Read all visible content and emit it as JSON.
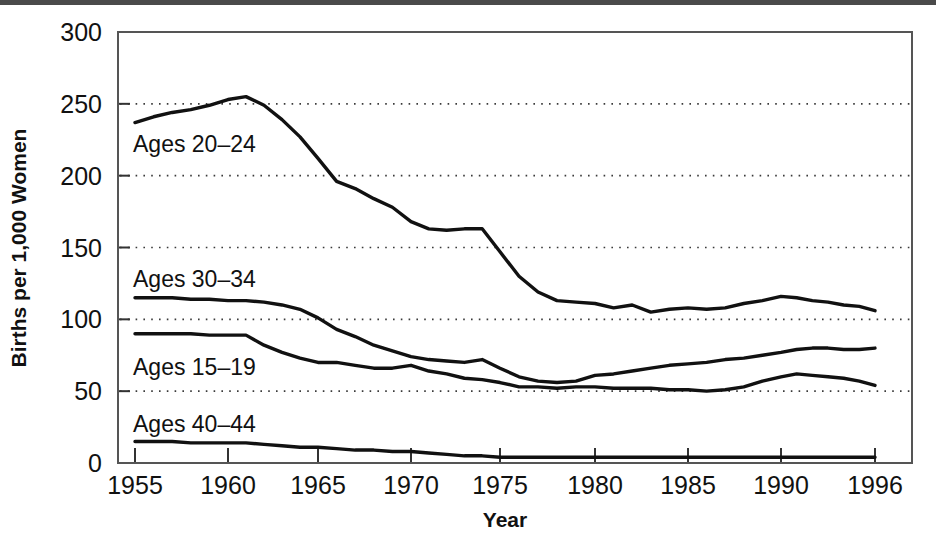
{
  "figure": {
    "name": "birth-rates-by-age-line-chart",
    "background_color": "#ffffff",
    "line_color": "#111111",
    "grid_color": "#3a3a3a",
    "frame_color": "#555555"
  },
  "axes": {
    "x_title": "Year",
    "y_title": "Births per 1,000 Women",
    "x_ticks": [
      "1955",
      "1960",
      "1965",
      "1970",
      "1975",
      "1980",
      "1985",
      "1990",
      "1996"
    ],
    "y_ticks": [
      "0",
      "50",
      "100",
      "150",
      "200",
      "250",
      "300"
    ]
  },
  "series_labels": [
    {
      "text": "Ages 20–24",
      "x": 133,
      "y": 152
    },
    {
      "text": "Ages 30–34",
      "x": 133,
      "y": 287
    },
    {
      "text": "Ages 15–19",
      "x": 133,
      "y": 375
    },
    {
      "text": "Ages 40–44",
      "x": 133,
      "y": 432
    }
  ],
  "chart_data": {
    "type": "line",
    "title": "",
    "xlabel": "Year",
    "ylabel": "Births per 1,000 Women",
    "xlim": [
      1955,
      1996
    ],
    "ylim": [
      0,
      300
    ],
    "grid": true,
    "gridlines_y": [
      50,
      100,
      150,
      200,
      250
    ],
    "legend": "inline-labels",
    "x_tick_values": [
      1955,
      1960,
      1965,
      1970,
      1975,
      1980,
      1985,
      1990,
      1996
    ],
    "y_tick_values": [
      0,
      50,
      100,
      150,
      200,
      250,
      300
    ],
    "x": [
      1955,
      1956,
      1957,
      1958,
      1959,
      1960,
      1961,
      1962,
      1963,
      1964,
      1965,
      1966,
      1967,
      1968,
      1969,
      1970,
      1971,
      1972,
      1973,
      1974,
      1975,
      1976,
      1977,
      1978,
      1979,
      1980,
      1981,
      1982,
      1983,
      1984,
      1985,
      1986,
      1987,
      1988,
      1989,
      1990,
      1991,
      1992,
      1993,
      1994,
      1995,
      1996
    ],
    "series": [
      {
        "name": "Ages 20–24",
        "values": [
          237,
          241,
          244,
          246,
          249,
          253,
          255,
          249,
          239,
          227,
          212,
          196,
          191,
          184,
          178,
          168,
          163,
          162,
          163,
          163,
          147,
          130,
          119,
          113,
          112,
          111,
          108,
          110,
          105,
          107,
          108,
          107,
          108,
          111,
          113,
          116,
          115,
          113,
          112,
          110,
          109,
          106
        ],
        "label_text": "Ages 20–24"
      },
      {
        "name": "Ages 30–34",
        "values": [
          115,
          115,
          115,
          114,
          114,
          113,
          113,
          112,
          110,
          107,
          101,
          93,
          88,
          82,
          78,
          74,
          72,
          71,
          70,
          72,
          66,
          60,
          57,
          56,
          57,
          61,
          62,
          64,
          66,
          68,
          69,
          70,
          72,
          73,
          75,
          77,
          79,
          80,
          80,
          79,
          79,
          80
        ],
        "label_text": "Ages 30–34"
      },
      {
        "name": "Ages 15–19",
        "values": [
          90,
          90,
          90,
          90,
          89,
          89,
          89,
          82,
          77,
          73,
          70,
          70,
          68,
          66,
          66,
          68,
          64,
          62,
          59,
          58,
          56,
          53,
          53,
          52,
          53,
          53,
          52,
          52,
          52,
          51,
          51,
          50,
          51,
          53,
          57,
          60,
          62,
          61,
          60,
          59,
          57,
          54
        ],
        "label_text": "Ages 15–19"
      },
      {
        "name": "Ages 40–44",
        "values": [
          15,
          15,
          15,
          14,
          14,
          14,
          14,
          13,
          12,
          11,
          11,
          10,
          9,
          9,
          8,
          8,
          7,
          6,
          5,
          5,
          4,
          4,
          4,
          4,
          4,
          4,
          4,
          4,
          4,
          4,
          4,
          4,
          4,
          4,
          4,
          4,
          4,
          4,
          4,
          4,
          4,
          4
        ],
        "label_text": "Ages 40–44"
      }
    ]
  }
}
